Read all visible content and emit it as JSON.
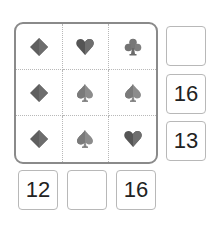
{
  "puzzle": {
    "type": "suit-sum-grid",
    "grid": [
      [
        {
          "suit": "diamond",
          "icon": "diamond-icon"
        },
        {
          "suit": "heart",
          "icon": "heart-icon"
        },
        {
          "suit": "club",
          "icon": "club-icon"
        }
      ],
      [
        {
          "suit": "diamond",
          "icon": "diamond-icon"
        },
        {
          "suit": "spade",
          "icon": "spade-icon"
        },
        {
          "suit": "spade",
          "icon": "spade-icon"
        }
      ],
      [
        {
          "suit": "diamond",
          "icon": "diamond-icon"
        },
        {
          "suit": "spade",
          "icon": "spade-icon"
        },
        {
          "suit": "heart",
          "icon": "heart-icon"
        }
      ]
    ],
    "row_clues": [
      "",
      "16",
      "13"
    ],
    "col_clues": [
      "12",
      "",
      "16"
    ]
  },
  "colors": {
    "diamond": "#5f5f5f",
    "heart": "#5a5a5a",
    "club": "#7a7a7a",
    "spade": "#8a8a8a",
    "grid_border": "#8a8a8a",
    "cell_divider": "#b8b8b8",
    "clue_border": "#b8b8b8",
    "clue_text": "#222222"
  }
}
